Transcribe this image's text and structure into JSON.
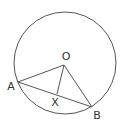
{
  "diagram": {
    "type": "geometry",
    "circle": {
      "cx": 65,
      "cy": 63,
      "r": 51,
      "stroke": "#555555"
    },
    "points": {
      "O": {
        "x": 64,
        "y": 65,
        "label": "O",
        "lx": 66,
        "ly": 60
      },
      "A": {
        "x": 18,
        "y": 82,
        "label": "A",
        "lx": 11,
        "ly": 90
      },
      "B": {
        "x": 92,
        "y": 107,
        "label": "B",
        "lx": 97,
        "ly": 119
      },
      "X": {
        "x": 57,
        "y": 94,
        "label": "X",
        "lx": 55,
        "ly": 106
      }
    },
    "segments": [
      {
        "from": "O",
        "to": "A"
      },
      {
        "from": "O",
        "to": "B"
      },
      {
        "from": "A",
        "to": "B"
      },
      {
        "from": "O",
        "to": "X"
      }
    ],
    "stroke_color": "#555555",
    "label_color": "#333333"
  }
}
